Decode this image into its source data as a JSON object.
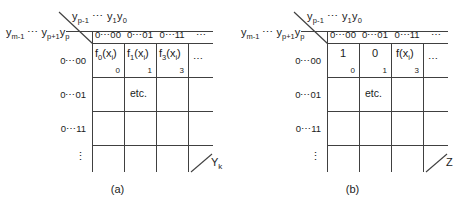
{
  "figure": {
    "type": "two-panel-table-diagram",
    "line_color": "#404040",
    "text_color": "#1b1b1b",
    "background": "#ffffff"
  },
  "panels": [
    {
      "id": "a",
      "caption": "(a)",
      "column_group_label": "yₚ₋₁ ⋯ y₁y₀",
      "column_group_label_parts": {
        "first": "y",
        "first_sub": "p-1",
        "mid": "⋯",
        "second": "y",
        "second_sub": "1",
        "third": "y",
        "third_sub": "0"
      },
      "row_group_label": "yₘ₋₁ ⋯ yₚ₊₁yₚ",
      "row_group_label_parts": {
        "first": "y",
        "first_sub": "m-1",
        "mid": "⋯",
        "second": "y",
        "second_sub": "p+1",
        "third": "y",
        "third_sub": "p"
      },
      "column_headers": [
        "0⋯00",
        "0⋯01",
        "0⋯11",
        "⋯"
      ],
      "row_headers": [
        "0⋯00",
        "0⋯01",
        "0⋯11",
        "⋮"
      ],
      "cells": [
        {
          "row": 0,
          "col": 0,
          "text": "f₀(xᵢ)",
          "base": "f",
          "base_sub": "0",
          "arg": "(x",
          "arg_sub": "i",
          "arg_end": ")",
          "index": "0"
        },
        {
          "row": 0,
          "col": 1,
          "text": "f₁(xᵢ)",
          "base": "f",
          "base_sub": "1",
          "arg": "(x",
          "arg_sub": "i",
          "arg_end": ")",
          "index": "1"
        },
        {
          "row": 0,
          "col": 2,
          "text": "f₃(xᵢ)",
          "base": "f",
          "base_sub": "3",
          "arg": "(x",
          "arg_sub": "i",
          "arg_end": ")",
          "index": "3"
        },
        {
          "row": 0,
          "col": 3,
          "text": "⋯",
          "base": "⋯",
          "base_sub": "",
          "arg": "",
          "arg_sub": "",
          "arg_end": "",
          "index": ""
        },
        {
          "row": 1,
          "col": 1,
          "text": "etc.",
          "base": "etc.",
          "base_sub": "",
          "arg": "",
          "arg_sub": "",
          "arg_end": "",
          "index": ""
        }
      ],
      "axis_label": "Y",
      "axis_label_sub": "k"
    },
    {
      "id": "b",
      "caption": "(b)",
      "column_group_label": "yₚ₋₁ ⋯ y₁y₀",
      "column_group_label_parts": {
        "first": "y",
        "first_sub": "p-1",
        "mid": "⋯",
        "second": "y",
        "second_sub": "1",
        "third": "y",
        "third_sub": "0"
      },
      "row_group_label": "yₘ₋₁ ⋯ yₚ₊₁yₚ",
      "row_group_label_parts": {
        "first": "y",
        "first_sub": "m-1",
        "mid": "⋯",
        "second": "y",
        "second_sub": "p+1",
        "third": "y",
        "third_sub": "p"
      },
      "column_headers": [
        "0⋯00",
        "0⋯01",
        "0⋯11",
        "⋯"
      ],
      "row_headers": [
        "0⋯00",
        "0⋯01",
        "0⋯11",
        "⋮"
      ],
      "cells": [
        {
          "row": 0,
          "col": 0,
          "text": "1",
          "base": "1",
          "base_sub": "",
          "arg": "",
          "arg_sub": "",
          "arg_end": "",
          "index": "0"
        },
        {
          "row": 0,
          "col": 1,
          "text": "0",
          "base": "0",
          "base_sub": "",
          "arg": "",
          "arg_sub": "",
          "arg_end": "",
          "index": "1"
        },
        {
          "row": 0,
          "col": 2,
          "text": "f(xᵢ)",
          "base": "f",
          "base_sub": "",
          "arg": "(x",
          "arg_sub": "i",
          "arg_end": ")",
          "index": "3"
        },
        {
          "row": 0,
          "col": 3,
          "text": "⋯",
          "base": "⋯",
          "base_sub": "",
          "arg": "",
          "arg_sub": "",
          "arg_end": "",
          "index": ""
        },
        {
          "row": 1,
          "col": 1,
          "text": "etc.",
          "base": "etc.",
          "base_sub": "",
          "arg": "",
          "arg_sub": "",
          "arg_end": "",
          "index": ""
        }
      ],
      "axis_label": "Z",
      "axis_label_sub": ""
    }
  ]
}
